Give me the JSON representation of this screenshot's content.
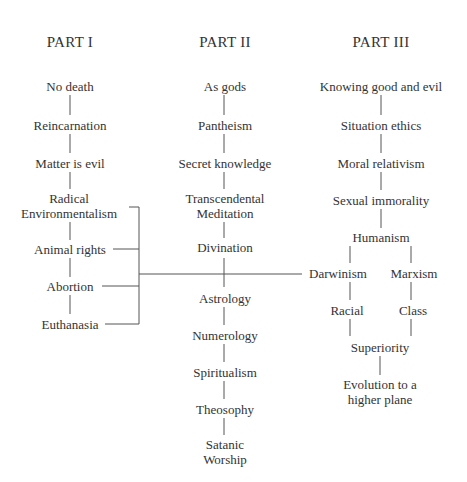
{
  "parts": [
    {
      "title": "PART I",
      "items": [
        "No death",
        "Reincarnation",
        "Matter is evil",
        "Radical\nEnvironmentalism",
        "Animal rights",
        "Abortion",
        "Euthanasia"
      ]
    },
    {
      "title": "PART II",
      "items": [
        "As gods",
        "Pantheism",
        "Secret knowledge",
        "Transcendental\nMeditation",
        "Divination",
        "Astrology",
        "Numerology",
        "Spiritualism",
        "Theosophy",
        "Satanic\nWorship"
      ]
    },
    {
      "title": "PART III",
      "items": [
        "Knowing good and evil",
        "Situation ethics",
        "Moral relativism",
        "Sexual immorality",
        "Humanism"
      ],
      "branches": [
        {
          "items": [
            "Darwinism",
            "Racial"
          ]
        },
        {
          "items": [
            "Marxism",
            "Class"
          ]
        }
      ],
      "merge_items": [
        "Superiority",
        "Evolution to a\nhigher plane"
      ]
    }
  ],
  "colors": {
    "text": "#333333",
    "line": "#555555",
    "background": "#ffffff"
  }
}
